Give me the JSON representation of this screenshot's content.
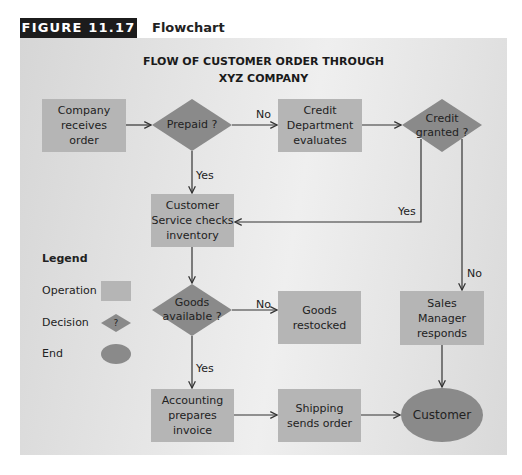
{
  "figure": {
    "label": "FIGURE 11.17",
    "caption": "Flowchart"
  },
  "diagram": {
    "title_line1": "FLOW OF CUSTOMER ORDER THROUGH",
    "title_line2": "XYZ COMPANY",
    "colors": {
      "operation_fill": "#b5b5b5",
      "decision_fill": "#8a8a8a",
      "end_fill": "#8a8a8a",
      "arrow": "#333333",
      "label_background": "#1c1c1c"
    },
    "nodes": {
      "receive_order": {
        "type": "operation",
        "label": "Company\nreceives\norder"
      },
      "prepaid": {
        "type": "decision",
        "label": "Prepaid ?"
      },
      "credit_dept": {
        "type": "operation",
        "label": "Credit\nDepartment\nevaluates"
      },
      "credit_granted": {
        "type": "decision",
        "label": "Credit\ngranted ?"
      },
      "customer_service": {
        "type": "operation",
        "label": "Customer\nService checks\ninventory"
      },
      "goods_available": {
        "type": "decision",
        "label": "Goods\navailable ?"
      },
      "goods_restocked": {
        "type": "operation",
        "label": "Goods\nrestocked"
      },
      "sales_manager": {
        "type": "operation",
        "label": "Sales\nManager\nresponds"
      },
      "accounting": {
        "type": "operation",
        "label": "Accounting\nprepares\ninvoice"
      },
      "shipping": {
        "type": "operation",
        "label": "Shipping\nsends order"
      },
      "customer": {
        "type": "end",
        "label": "Customer"
      }
    },
    "edges": [
      {
        "from": "receive_order",
        "to": "prepaid",
        "label": ""
      },
      {
        "from": "prepaid",
        "to": "credit_dept",
        "label": "No"
      },
      {
        "from": "prepaid",
        "to": "customer_service",
        "label": "Yes"
      },
      {
        "from": "credit_dept",
        "to": "credit_granted",
        "label": ""
      },
      {
        "from": "credit_granted",
        "to": "customer_service",
        "label": "Yes"
      },
      {
        "from": "credit_granted",
        "to": "sales_manager",
        "label": "No"
      },
      {
        "from": "customer_service",
        "to": "goods_available",
        "label": ""
      },
      {
        "from": "goods_available",
        "to": "goods_restocked",
        "label": "No"
      },
      {
        "from": "goods_available",
        "to": "accounting",
        "label": "Yes"
      },
      {
        "from": "accounting",
        "to": "shipping",
        "label": ""
      },
      {
        "from": "shipping",
        "to": "customer",
        "label": ""
      },
      {
        "from": "sales_manager",
        "to": "customer",
        "label": ""
      }
    ],
    "edge_labels": {
      "prepaid_no": "No",
      "prepaid_yes": "Yes",
      "credit_yes": "Yes",
      "credit_no": "No",
      "goods_no": "No",
      "goods_yes": "Yes"
    },
    "legend": {
      "title": "Legend",
      "operation": "Operation",
      "decision": "Decision",
      "decision_symbol": "?",
      "end": "End"
    }
  }
}
